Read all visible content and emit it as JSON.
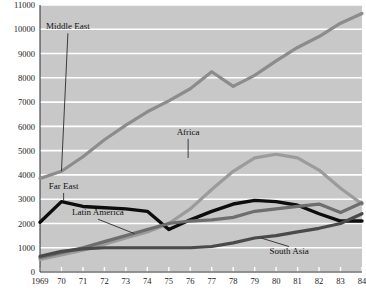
{
  "chart_data": {
    "type": "line",
    "title": "",
    "subtitle": "",
    "xlabel": "",
    "ylabel": "",
    "xlim": [
      1969,
      1984
    ],
    "ylim": [
      0,
      11000
    ],
    "y_ticks": [
      0,
      1000,
      2000,
      3000,
      4000,
      5000,
      6000,
      7000,
      8000,
      9000,
      10000,
      11000
    ],
    "y_tick_labels": [
      "0",
      "1000",
      "2000",
      "3000",
      "4000",
      "5000",
      "6000",
      "7000",
      "8000",
      "9000",
      "10000",
      "11000"
    ],
    "x": [
      1969,
      1970,
      1971,
      1972,
      1973,
      1974,
      1975,
      1976,
      1977,
      1978,
      1979,
      1980,
      1981,
      1982,
      1983,
      1984
    ],
    "x_tick_labels": [
      "1969",
      "70",
      "71",
      "72",
      "73",
      "74",
      "75",
      "76",
      "77",
      "78",
      "79",
      "80",
      "81",
      "82",
      "83",
      "84"
    ],
    "grid": "horizontal",
    "grid_color": "#ffffff",
    "plot_background": "#c8c8c8",
    "legend": "inline-annotations",
    "series": [
      {
        "name": "Middle East",
        "color": "#8c8c8c",
        "width": 3.2,
        "label_x": 1970.3,
        "label_y": 10000,
        "leader_to_x": 1970.0,
        "leader_to_y": 4150,
        "values": [
          3850,
          4150,
          4750,
          5450,
          6050,
          6600,
          7050,
          7550,
          8250,
          7650,
          8100,
          8700,
          9250,
          9700,
          10250,
          10650
        ]
      },
      {
        "name": "Africa",
        "color": "#9b9b9b",
        "width": 3.2,
        "label_x": 1975.9,
        "label_y": 5650,
        "leader_to_x": 1975.9,
        "leader_to_y": 4700,
        "values": [
          520,
          700,
          900,
          1150,
          1400,
          1650,
          2000,
          2600,
          3400,
          4150,
          4700,
          4850,
          4700,
          4200,
          3450,
          2800
        ]
      },
      {
        "name": "Far East",
        "color": "#0d0d0d",
        "width": 3.4,
        "label_x": 1970.1,
        "label_y": 3420,
        "leader_to_x": 1970.1,
        "leader_to_y": 2950,
        "values": [
          2050,
          2900,
          2700,
          2650,
          2600,
          2500,
          1750,
          2150,
          2500,
          2800,
          2950,
          2900,
          2750,
          2400,
          2100,
          2100
        ]
      },
      {
        "name": "Latin America",
        "color": "#6e6e6e",
        "width": 3.2,
        "label_x": 1971.7,
        "label_y": 2340,
        "leader_to_x": 1973.4,
        "leader_to_y": 1580,
        "values": [
          600,
          800,
          1000,
          1250,
          1500,
          1750,
          2000,
          2100,
          2150,
          2250,
          2500,
          2600,
          2700,
          2800,
          2450,
          2850
        ]
      },
      {
        "name": "South Asia",
        "color": "#4a4a4a",
        "width": 3.2,
        "label_x": 1980.6,
        "label_y": 760,
        "leader_to_x": 1979.3,
        "leader_to_y": 1400,
        "values": [
          650,
          850,
          950,
          1000,
          1000,
          1000,
          1000,
          1000,
          1050,
          1200,
          1400,
          1500,
          1650,
          1800,
          2000,
          2400
        ]
      }
    ]
  }
}
